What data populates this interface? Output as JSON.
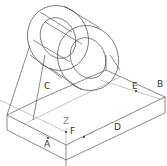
{
  "diagram": {
    "type": "isometric-wireframe",
    "labels": {
      "A": "A",
      "B": "B",
      "C": "C",
      "D": "D",
      "E": "E",
      "F": "F",
      "Z": "Z"
    },
    "colors": {
      "line": "#3a3a3a",
      "construction_line": "#8a8a8a",
      "background": "#ffffff"
    }
  }
}
